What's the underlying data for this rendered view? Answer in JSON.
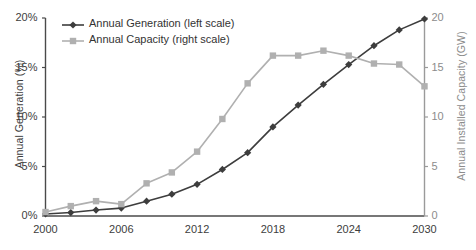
{
  "chart_data": {
    "type": "line",
    "title": "",
    "xlabel": "",
    "ylabel": "Annual Generation (%)",
    "y2label": "Annual Installed Capacity (GW)",
    "xlim": [
      2000,
      2030
    ],
    "ylim": [
      0,
      20
    ],
    "y2lim": [
      0,
      20
    ],
    "grid": false,
    "legend_position": "top-left",
    "x_ticks": [
      "2000",
      "2006",
      "2012",
      "2018",
      "2024",
      "2030"
    ],
    "x_tick_values": [
      2000,
      2006,
      2012,
      2018,
      2024,
      2030
    ],
    "y_ticks": [
      "0%",
      "5%",
      "10%",
      "15%",
      "20%"
    ],
    "y_tick_values": [
      0,
      5,
      10,
      15,
      20
    ],
    "y2_ticks": [
      "0",
      "5",
      "10",
      "15",
      "20"
    ],
    "y2_tick_values": [
      0,
      5,
      10,
      15,
      20
    ],
    "x": [
      2000,
      2002,
      2004,
      2006,
      2008,
      2010,
      2012,
      2014,
      2016,
      2018,
      2020,
      2022,
      2024,
      2026,
      2028,
      2030
    ],
    "series": [
      {
        "name": "Annual Generation (left scale)",
        "axis": "left",
        "color": "#3d3d3d",
        "marker": "diamond",
        "values": [
          0.2,
          0.35,
          0.6,
          0.8,
          1.5,
          2.2,
          3.2,
          4.7,
          6.4,
          9.0,
          11.2,
          13.3,
          15.3,
          17.2,
          18.8,
          19.9
        ]
      },
      {
        "name": "Annual Capacity (right scale)",
        "axis": "right",
        "color": "#b0b0b0",
        "marker": "square",
        "values": [
          0.4,
          1.0,
          1.5,
          1.2,
          3.3,
          4.4,
          6.5,
          9.8,
          13.4,
          16.2,
          16.2,
          16.7,
          16.2,
          15.4,
          15.3,
          13.1
        ]
      }
    ]
  },
  "legend": {
    "items": [
      {
        "label": "Annual Generation (left scale)",
        "color": "#3d3d3d",
        "marker": "diamond"
      },
      {
        "label": "Annual Capacity (right scale)",
        "color": "#b0b0b0",
        "marker": "square"
      }
    ]
  },
  "axes": {
    "left_title": "Annual Generation (%)",
    "right_title": "Annual Installed Capacity (GW)"
  }
}
